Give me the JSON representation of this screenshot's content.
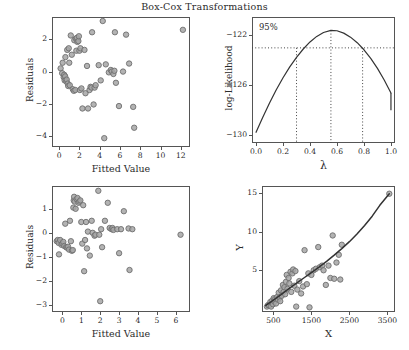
{
  "figure": {
    "title": "Box-Cox Transformations",
    "background": "#ffffff",
    "marker_fill": "#a6a6a6",
    "marker_stroke": "#6e6e6e",
    "line_color": "#333333",
    "axis_color": "#555555"
  },
  "chart_data": [
    {
      "id": "residuals-vs-fitted-untransformed",
      "type": "scatter",
      "title": "",
      "xlabel": "Fitted Value",
      "ylabel": "Residuals",
      "xlim": [
        -0.7,
        12.9
      ],
      "ylim": [
        -4.7,
        3.4
      ],
      "xticks": [
        0,
        2,
        4,
        6,
        8,
        10,
        12
      ],
      "yticks": [
        -4,
        -2,
        0,
        2
      ],
      "grid": false,
      "legend": "none",
      "points": [
        [
          0.15,
          0.2
        ],
        [
          0.3,
          -0.1
        ],
        [
          0.35,
          0.55
        ],
        [
          0.45,
          -0.35
        ],
        [
          0.5,
          -0.2
        ],
        [
          0.55,
          -0.55
        ],
        [
          0.6,
          -0.3
        ],
        [
          0.62,
          0.9
        ],
        [
          0.7,
          -0.6
        ],
        [
          0.75,
          -0.5
        ],
        [
          0.8,
          1.35
        ],
        [
          0.85,
          -0.75
        ],
        [
          0.9,
          -0.9
        ],
        [
          0.95,
          1.45
        ],
        [
          1.0,
          0.55
        ],
        [
          1.05,
          -0.85
        ],
        [
          1.15,
          2.25
        ],
        [
          1.25,
          1.05
        ],
        [
          1.35,
          -1.1
        ],
        [
          1.45,
          -1.2
        ],
        [
          1.5,
          1.95
        ],
        [
          1.6,
          -1.15
        ],
        [
          1.65,
          2.05
        ],
        [
          1.7,
          1.3
        ],
        [
          1.75,
          2.1
        ],
        [
          1.8,
          1.85
        ],
        [
          1.9,
          1.9
        ],
        [
          1.95,
          2.2
        ],
        [
          2.0,
          1.3
        ],
        [
          2.05,
          -1.15
        ],
        [
          2.1,
          1.45
        ],
        [
          2.2,
          -1.05
        ],
        [
          2.3,
          -2.3
        ],
        [
          2.5,
          1.35
        ],
        [
          2.6,
          -1.35
        ],
        [
          2.75,
          0.35
        ],
        [
          2.85,
          -2.3
        ],
        [
          3.0,
          -1.15
        ],
        [
          3.1,
          -0.95
        ],
        [
          3.2,
          -1.0
        ],
        [
          3.25,
          2.45
        ],
        [
          3.4,
          -2.05
        ],
        [
          3.5,
          -1.0
        ],
        [
          3.6,
          -0.85
        ],
        [
          3.9,
          0.4
        ],
        [
          4.1,
          -0.55
        ],
        [
          4.3,
          3.15
        ],
        [
          4.45,
          -4.15
        ],
        [
          4.6,
          0.45
        ],
        [
          4.9,
          -0.05
        ],
        [
          5.1,
          0.1
        ],
        [
          5.2,
          0.0
        ],
        [
          5.35,
          -0.15
        ],
        [
          5.45,
          0.05
        ],
        [
          5.5,
          2.45
        ],
        [
          5.6,
          -0.7
        ],
        [
          5.9,
          -2.15
        ],
        [
          6.3,
          0.0
        ],
        [
          6.6,
          2.3
        ],
        [
          6.9,
          0.5
        ],
        [
          7.3,
          -2.2
        ],
        [
          7.4,
          -3.5
        ],
        [
          12.2,
          2.6
        ]
      ]
    },
    {
      "id": "log-likelihood-vs-lambda",
      "type": "line",
      "title": "",
      "xlabel": "λ",
      "ylabel": "log-Likelihood",
      "xlim": [
        -0.03,
        1.03
      ],
      "ylim": [
        -130.6,
        -120.6
      ],
      "xticks": [
        0.0,
        0.2,
        0.4,
        0.6,
        0.8,
        1.0
      ],
      "xtick_labels": [
        "0.0",
        "0.2",
        "0.4",
        "0.6",
        "0.8",
        "1.0"
      ],
      "yticks": [
        -130,
        -126,
        -122
      ],
      "ytick_labels": [
        "−130",
        "−126",
        "−122"
      ],
      "grid": false,
      "legend": "none",
      "annotation": "95%",
      "ci_level_label": "95%",
      "ci_lower_lambda": 0.3,
      "ci_upper_lambda": 0.79,
      "mle_lambda": 0.555,
      "ci_threshold_loglik": -123.05,
      "curve": [
        [
          0.0,
          -129.75
        ],
        [
          0.05,
          -128.55
        ],
        [
          0.1,
          -127.42
        ],
        [
          0.15,
          -126.38
        ],
        [
          0.2,
          -125.42
        ],
        [
          0.25,
          -124.56
        ],
        [
          0.3,
          -123.8
        ],
        [
          0.35,
          -123.14
        ],
        [
          0.4,
          -122.58
        ],
        [
          0.45,
          -122.14
        ],
        [
          0.5,
          -121.83
        ],
        [
          0.555,
          -121.66
        ],
        [
          0.6,
          -121.69
        ],
        [
          0.65,
          -121.88
        ],
        [
          0.7,
          -122.2
        ],
        [
          0.75,
          -122.64
        ],
        [
          0.8,
          -123.2
        ],
        [
          0.85,
          -123.88
        ],
        [
          0.9,
          -124.68
        ],
        [
          0.95,
          -125.6
        ],
        [
          1.0,
          -126.63
        ],
        [
          1.0,
          -128.0
        ]
      ]
    },
    {
      "id": "residuals-vs-fitted-transformed",
      "type": "scatter",
      "title": "",
      "xlabel": "Fitted Value",
      "ylabel": "Residuals",
      "xlim": [
        -0.55,
        6.75
      ],
      "ylim": [
        -3.3,
        1.95
      ],
      "xticks": [
        0,
        1,
        2,
        3,
        4,
        5,
        6
      ],
      "yticks": [
        -3,
        -2,
        -1,
        0,
        1
      ],
      "grid": false,
      "legend": "none",
      "points": [
        [
          -0.3,
          -0.35
        ],
        [
          -0.25,
          -0.3
        ],
        [
          -0.2,
          -0.42
        ],
        [
          -0.18,
          -0.9
        ],
        [
          -0.12,
          -0.3
        ],
        [
          -0.05,
          -0.5
        ],
        [
          0.0,
          -0.45
        ],
        [
          0.05,
          -0.38
        ],
        [
          0.1,
          -0.55
        ],
        [
          0.15,
          0.38
        ],
        [
          0.2,
          -0.6
        ],
        [
          0.25,
          -0.62
        ],
        [
          0.3,
          -0.58
        ],
        [
          0.35,
          -0.7
        ],
        [
          0.4,
          0.5
        ],
        [
          0.45,
          -0.35
        ],
        [
          0.5,
          -0.75
        ],
        [
          0.55,
          -0.72
        ],
        [
          0.58,
          1.05
        ],
        [
          0.6,
          1.35
        ],
        [
          0.62,
          1.5
        ],
        [
          0.65,
          1.3
        ],
        [
          0.7,
          1.0
        ],
        [
          0.75,
          1.4
        ],
        [
          0.8,
          1.45
        ],
        [
          0.85,
          1.25
        ],
        [
          0.9,
          1.3
        ],
        [
          0.95,
          1.35
        ],
        [
          1.0,
          0.45
        ],
        [
          1.05,
          -0.45
        ],
        [
          1.1,
          1.15
        ],
        [
          1.15,
          -1.6
        ],
        [
          1.2,
          -0.3
        ],
        [
          1.25,
          0.45
        ],
        [
          1.3,
          -0.65
        ],
        [
          1.35,
          0.05
        ],
        [
          1.45,
          -0.95
        ],
        [
          1.55,
          0.5
        ],
        [
          1.6,
          0.0
        ],
        [
          1.7,
          -0.12
        ],
        [
          1.75,
          -0.08
        ],
        [
          1.9,
          1.75
        ],
        [
          1.95,
          -0.08
        ],
        [
          2.0,
          -2.85
        ],
        [
          2.05,
          0.15
        ],
        [
          2.1,
          -0.6
        ],
        [
          2.25,
          0.5
        ],
        [
          2.4,
          1.25
        ],
        [
          2.5,
          0.2
        ],
        [
          2.6,
          0.15
        ],
        [
          2.65,
          0.2
        ],
        [
          2.7,
          0.12
        ],
        [
          2.9,
          0.15
        ],
        [
          3.0,
          -0.85
        ],
        [
          3.1,
          0.15
        ],
        [
          3.25,
          0.9
        ],
        [
          3.5,
          0.18
        ],
        [
          3.55,
          -1.55
        ],
        [
          3.7,
          0.15
        ],
        [
          6.25,
          -0.08
        ]
      ]
    },
    {
      "id": "y-vs-x",
      "type": "scatter",
      "title": "",
      "xlabel": "X",
      "ylabel": "Y",
      "xlim": [
        200,
        3700
      ],
      "ylim": [
        -0.4,
        15.9
      ],
      "xticks": [
        500,
        1500,
        2500,
        3500
      ],
      "yticks": [
        5,
        10,
        15
      ],
      "grid": false,
      "legend": "none",
      "has_fit_line": true,
      "fit_line": [
        [
          300,
          0.45
        ],
        [
          500,
          1.15
        ],
        [
          700,
          1.85
        ],
        [
          900,
          2.6
        ],
        [
          1100,
          3.3
        ],
        [
          1300,
          4.0
        ],
        [
          1500,
          4.7
        ],
        [
          1700,
          5.4
        ],
        [
          1900,
          6.15
        ],
        [
          2100,
          6.95
        ],
        [
          2300,
          7.8
        ],
        [
          2500,
          8.7
        ],
        [
          2700,
          9.7
        ],
        [
          2900,
          10.8
        ],
        [
          3100,
          12.0
        ],
        [
          3300,
          13.4
        ],
        [
          3550,
          14.9
        ]
      ],
      "points": [
        [
          330,
          0.3
        ],
        [
          360,
          0.5
        ],
        [
          390,
          0.45
        ],
        [
          420,
          0.9
        ],
        [
          440,
          0.3
        ],
        [
          470,
          1.1
        ],
        [
          490,
          0.6
        ],
        [
          510,
          1.4
        ],
        [
          530,
          0.95
        ],
        [
          550,
          1.3
        ],
        [
          570,
          0.7
        ],
        [
          600,
          1.55
        ],
        [
          620,
          1.2
        ],
        [
          640,
          2.1
        ],
        [
          660,
          1.5
        ],
        [
          680,
          1.0
        ],
        [
          700,
          2.4
        ],
        [
          720,
          1.7
        ],
        [
          750,
          3.1
        ],
        [
          770,
          2.2
        ],
        [
          790,
          2.8
        ],
        [
          810,
          1.9
        ],
        [
          830,
          3.5
        ],
        [
          850,
          4.4
        ],
        [
          870,
          2.6
        ],
        [
          900,
          4.0
        ],
        [
          920,
          3.3
        ],
        [
          950,
          4.8
        ],
        [
          970,
          2.2
        ],
        [
          1000,
          4.6
        ],
        [
          1020,
          5.1
        ],
        [
          1050,
          3.0
        ],
        [
          1080,
          4.9
        ],
        [
          1100,
          0.3
        ],
        [
          1130,
          2.5
        ],
        [
          1180,
          3.6
        ],
        [
          1230,
          2.0
        ],
        [
          1280,
          2.9
        ],
        [
          1320,
          7.6
        ],
        [
          1380,
          3.2
        ],
        [
          1420,
          4.6
        ],
        [
          1450,
          0.2
        ],
        [
          1500,
          4.4
        ],
        [
          1560,
          5.0
        ],
        [
          1620,
          5.2
        ],
        [
          1680,
          8.0
        ],
        [
          1720,
          5.4
        ],
        [
          1780,
          5.6
        ],
        [
          1820,
          5.0
        ],
        [
          1880,
          3.1
        ],
        [
          1950,
          5.6
        ],
        [
          2000,
          4.0
        ],
        [
          2060,
          9.5
        ],
        [
          2100,
          3.9
        ],
        [
          2160,
          6.0
        ],
        [
          2220,
          7.0
        ],
        [
          2260,
          3.8
        ],
        [
          2300,
          8.3
        ],
        [
          3550,
          14.9
        ]
      ]
    }
  ],
  "caption": {
    "text": "",
    "visible": false
  }
}
